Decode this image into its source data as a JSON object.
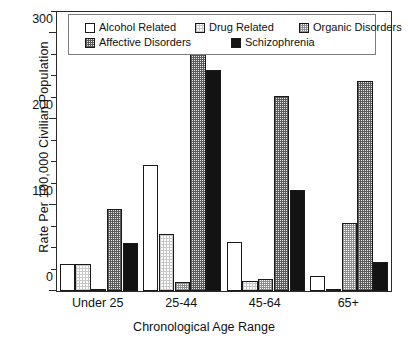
{
  "chart_data": {
    "type": "bar",
    "title": "",
    "xlabel": "Chronological Age Range",
    "ylabel": "Rate Per 100,000 Civilian Population",
    "categories": [
      "Under 25",
      "25-44",
      "45-64",
      "65+"
    ],
    "ylim": [
      0,
      325
    ],
    "yticks": [
      0,
      100,
      200,
      300
    ],
    "ytick_labels": [
      "0",
      "100",
      "200",
      "300"
    ],
    "minor_tick_interval": 25,
    "grid": false,
    "legend_position": "top-inside",
    "series": [
      {
        "name": "Alcohol Related",
        "fill": "white",
        "values": [
          32,
          147,
          57,
          18
        ]
      },
      {
        "name": "Drug Related",
        "fill": "light-grid",
        "values": [
          32,
          66,
          12,
          1
        ]
      },
      {
        "name": "Organic Disorders",
        "fill": "mid-grid",
        "values": [
          2,
          10,
          14,
          79
        ]
      },
      {
        "name": "Affective Disorders",
        "fill": "dark-grid",
        "values": [
          96,
          300,
          227,
          245
        ]
      },
      {
        "name": "Schizophrenia",
        "fill": "black",
        "values": [
          56,
          258,
          118,
          34
        ]
      }
    ]
  },
  "colors": {
    "axis": "#2a2a2a",
    "legend_border": "#7d7d7d",
    "background": "#ffffff",
    "black_series": "#131313"
  }
}
